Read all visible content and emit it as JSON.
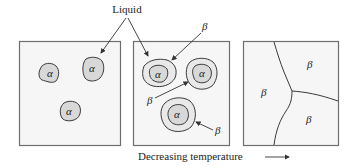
{
  "figure": {
    "caption_label": "Liquid",
    "axis_label": "Decreasing temperature",
    "axis_arrow_icon": "right-arrow",
    "panels": [
      {
        "id": "panel-1",
        "description": "Alpha nuclei in liquid",
        "labels": [
          "α",
          "α",
          "α"
        ]
      },
      {
        "id": "panel-2",
        "description": "Beta forming around alpha grains (peritectic)",
        "labels": [
          "α",
          "α",
          "α"
        ],
        "beta_labels": [
          "β",
          "β",
          "β"
        ]
      },
      {
        "id": "panel-3",
        "description": "Fully solidified beta grains",
        "labels": [
          "β",
          "β",
          "β"
        ]
      }
    ]
  },
  "colors": {
    "panel_fill": "#f6f6f6",
    "panel_border": "#6e6e6e",
    "alpha_fill": "#d8d8d8",
    "beta_fill": "#e9e9e9",
    "line": "#3a3a3a"
  }
}
